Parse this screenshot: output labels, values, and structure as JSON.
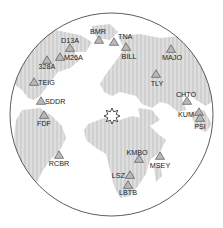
{
  "map": {
    "projection": "azimuthal-globe",
    "circle": {
      "cx": 111.5,
      "cy": 114.5,
      "r": 101.5
    },
    "colors": {
      "land": "#dcdcdc",
      "land_stripe": "#cfcfcf",
      "ocean": "#ffffff",
      "outline": "#333333",
      "station_fill": "#b8b8b8",
      "station_stroke": "#444444"
    },
    "epicenter": {
      "name": "event",
      "x": 112,
      "y": 116
    },
    "stations": [
      {
        "code": "BMR",
        "x": 99,
        "y": 40,
        "lx": 98,
        "ly": 34,
        "anchor": "middle"
      },
      {
        "code": "TNA",
        "x": 114,
        "y": 42,
        "lx": 118,
        "ly": 39,
        "anchor": "start"
      },
      {
        "code": "D13A",
        "x": 70,
        "y": 48,
        "lx": 70,
        "ly": 43,
        "anchor": "middle"
      },
      {
        "code": "BILL",
        "x": 126,
        "y": 47,
        "lx": 129,
        "ly": 59,
        "anchor": "middle"
      },
      {
        "code": "M26A",
        "x": 60,
        "y": 57,
        "lx": 64,
        "ly": 60,
        "anchor": "start"
      },
      {
        "code": "328A",
        "x": 47,
        "y": 60,
        "lx": 47,
        "ly": 69,
        "anchor": "middle"
      },
      {
        "code": "MAJO",
        "x": 171,
        "y": 49,
        "lx": 172,
        "ly": 60,
        "anchor": "middle"
      },
      {
        "code": "TLY",
        "x": 156,
        "y": 74,
        "lx": 157,
        "ly": 86,
        "anchor": "middle"
      },
      {
        "code": "TEIG",
        "x": 34,
        "y": 82,
        "lx": 38,
        "ly": 85,
        "anchor": "start"
      },
      {
        "code": "SDDR",
        "x": 41,
        "y": 101,
        "lx": 45,
        "ly": 104,
        "anchor": "start"
      },
      {
        "code": "FDF",
        "x": 44,
        "y": 115,
        "lx": 44,
        "ly": 126,
        "anchor": "middle"
      },
      {
        "code": "CHTO",
        "x": 187,
        "y": 101,
        "lx": 186,
        "ly": 97,
        "anchor": "middle"
      },
      {
        "code": "KUM",
        "x": 199,
        "y": 112,
        "lx": 194,
        "ly": 117,
        "anchor": "end"
      },
      {
        "code": "PSI",
        "x": 200,
        "y": 118,
        "lx": 200,
        "ly": 129,
        "anchor": "middle"
      },
      {
        "code": "RCBR",
        "x": 59,
        "y": 155,
        "lx": 59,
        "ly": 166,
        "anchor": "middle"
      },
      {
        "code": "KMBO",
        "x": 139,
        "y": 159,
        "lx": 137,
        "ly": 155,
        "anchor": "middle"
      },
      {
        "code": "MSEY",
        "x": 160,
        "y": 156,
        "lx": 160,
        "ly": 168,
        "anchor": "middle"
      },
      {
        "code": "LSZ",
        "x": 130,
        "y": 175,
        "lx": 125,
        "ly": 178,
        "anchor": "end"
      },
      {
        "code": "LBTB",
        "x": 128,
        "y": 185,
        "lx": 128,
        "ly": 195,
        "anchor": "middle"
      }
    ]
  }
}
